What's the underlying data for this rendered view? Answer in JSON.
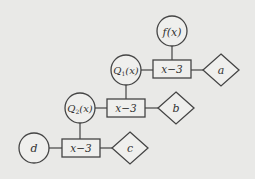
{
  "diagram": {
    "background": "#e9e9e7",
    "stroke_color": "#444444",
    "node_fill": "#efefed",
    "nodes": {
      "fx": {
        "label": "f(x)",
        "shape": "circle",
        "cx": 172,
        "cy": 31,
        "r": 15
      },
      "q1": {
        "label_main": "Q",
        "label_sub": "1",
        "label_tail": "(x)",
        "shape": "circle",
        "cx": 126,
        "cy": 70,
        "r": 15
      },
      "box1": {
        "label": "x−3",
        "shape": "rect",
        "x": 153,
        "y": 60,
        "w": 38,
        "h": 18
      },
      "a": {
        "label": "a",
        "shape": "diamond",
        "cx": 221,
        "cy": 70,
        "hw": 18,
        "hh": 16
      },
      "q2": {
        "label_main": "Q",
        "label_sub": "2",
        "label_tail": "(x)",
        "shape": "circle",
        "cx": 80,
        "cy": 108,
        "r": 15
      },
      "box2": {
        "label": "x−3",
        "shape": "rect",
        "x": 107,
        "y": 99,
        "w": 38,
        "h": 18
      },
      "b": {
        "label": "b",
        "shape": "diamond",
        "cx": 176,
        "cy": 108,
        "hw": 18,
        "hh": 16
      },
      "d": {
        "label": "d",
        "shape": "circle",
        "cx": 34,
        "cy": 148,
        "r": 15
      },
      "box3": {
        "label": "x−3",
        "shape": "rect",
        "x": 62,
        "y": 139,
        "w": 38,
        "h": 18
      },
      "c": {
        "label": "c",
        "shape": "diamond",
        "cx": 130,
        "cy": 148,
        "hw": 18,
        "hh": 16
      }
    },
    "edges": [
      {
        "from": "fx",
        "to": "box1"
      },
      {
        "from": "q1",
        "to": "box1"
      },
      {
        "from": "box1",
        "to": "a"
      },
      {
        "from": "q1",
        "to": "box2"
      },
      {
        "from": "q2",
        "to": "box2"
      },
      {
        "from": "box2",
        "to": "b"
      },
      {
        "from": "q2",
        "to": "box3"
      },
      {
        "from": "d",
        "to": "box3"
      },
      {
        "from": "box3",
        "to": "c"
      }
    ]
  }
}
